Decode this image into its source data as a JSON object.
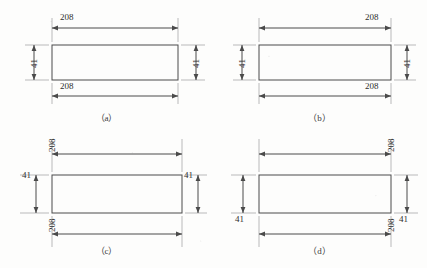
{
  "figure": {
    "line_color": "#4a4a4a",
    "text_color": "#2e2e2e",
    "background": "#fdfdfc"
  },
  "shape": {
    "length_label": "208",
    "height_label": "41"
  },
  "panels": [
    {
      "id": "a",
      "caption": "（a）",
      "top_dim": {
        "value": "208",
        "orientation": "horizontal",
        "align": "left"
      },
      "bottom_dim": {
        "value": "208",
        "orientation": "horizontal",
        "align": "left"
      },
      "left_dim": {
        "value": "41",
        "orientation": "vertical-rotated",
        "align": "middle"
      },
      "right_dim": {
        "value": "41",
        "orientation": "vertical-rotated",
        "align": "middle"
      }
    },
    {
      "id": "b",
      "caption": "（b）",
      "top_dim": {
        "value": "208",
        "orientation": "horizontal",
        "align": "right"
      },
      "bottom_dim": {
        "value": "208",
        "orientation": "horizontal",
        "align": "right"
      },
      "left_dim": {
        "value": "41",
        "orientation": "vertical-rotated",
        "align": "middle"
      },
      "right_dim": {
        "value": "41",
        "orientation": "vertical-rotated",
        "align": "middle"
      }
    },
    {
      "id": "c",
      "caption": "（c）",
      "top_dim": {
        "value": "208",
        "orientation": "vertical-rotated",
        "align": "left"
      },
      "bottom_dim": {
        "value": "208",
        "orientation": "vertical-rotated",
        "align": "left"
      },
      "left_dim": {
        "value": "41",
        "orientation": "horizontal",
        "align": "top"
      },
      "right_dim": {
        "value": "41",
        "orientation": "horizontal",
        "align": "top"
      }
    },
    {
      "id": "d",
      "caption": "（d）",
      "top_dim": {
        "value": "208",
        "orientation": "vertical-rotated",
        "align": "right"
      },
      "bottom_dim": {
        "value": "208",
        "orientation": "vertical-rotated",
        "align": "right"
      },
      "left_dim": {
        "value": "41",
        "orientation": "horizontal",
        "align": "bottom"
      },
      "right_dim": {
        "value": "41",
        "orientation": "horizontal",
        "align": "bottom"
      }
    }
  ]
}
